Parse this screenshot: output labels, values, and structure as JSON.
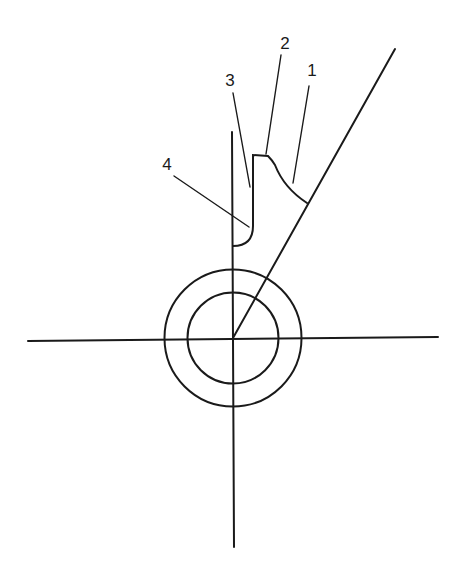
{
  "diagram": {
    "type": "cutting-tool-angle-sketch",
    "labels": [
      {
        "id": "1",
        "text": "1",
        "x": 312,
        "y": 76
      },
      {
        "id": "2",
        "text": "2",
        "x": 285,
        "y": 49
      },
      {
        "id": "3",
        "text": "3",
        "x": 230,
        "y": 86
      },
      {
        "id": "4",
        "text": "4",
        "x": 167,
        "y": 170
      }
    ],
    "stroke_color": "#1a1a1a",
    "background": "#ffffff"
  }
}
